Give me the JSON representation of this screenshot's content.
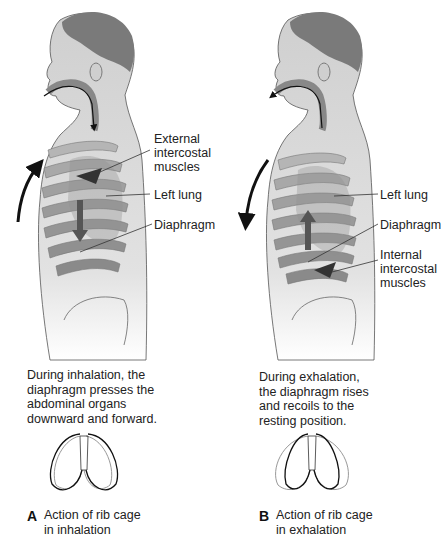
{
  "panels": [
    {
      "letter": "A",
      "title": "Action of rib cage\nin inhalation",
      "caption": "During inhalation, the\ndiaphragm presses the\nabdominal organs\ndownward and forward.",
      "labels": {
        "external_intercostal": "External\nintercostal\nmuscles",
        "left_lung": "Left lung",
        "diaphragm": "Diaphragm"
      },
      "rib_arrow_direction": "up",
      "diaphragm_arrow_direction": "down"
    },
    {
      "letter": "B",
      "title": "Action of rib cage\nin exhalation",
      "caption": "During exhalation,\nthe diaphragm rises\nand recoils to the\nresting position.",
      "labels": {
        "left_lung": "Left lung",
        "diaphragm": "Diaphragm",
        "internal_intercostal": "Internal\nintercostal\nmuscles"
      },
      "rib_arrow_direction": "down",
      "diaphragm_arrow_direction": "up"
    }
  ],
  "colors": {
    "skin": "#d9d9d9",
    "hair": "#7a7a7a",
    "rib": "#a0a0a0",
    "muscle": "#6e6e6e",
    "arrow": "#111111"
  }
}
